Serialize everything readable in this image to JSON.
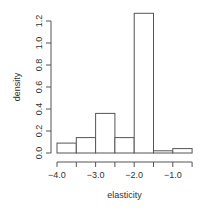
{
  "chart_data": {
    "type": "bar",
    "title": "",
    "xlabel": "elasticity",
    "ylabel": "density",
    "bins": [
      {
        "x0": -4.0,
        "x1": -3.5,
        "density": 0.09
      },
      {
        "x0": -3.5,
        "x1": -3.0,
        "density": 0.14
      },
      {
        "x0": -3.0,
        "x1": -2.5,
        "density": 0.36
      },
      {
        "x0": -2.5,
        "x1": -2.0,
        "density": 0.14
      },
      {
        "x0": -2.0,
        "x1": -1.5,
        "density": 1.27
      },
      {
        "x0": -1.5,
        "x1": -1.0,
        "density": 0.02
      },
      {
        "x0": -1.0,
        "x1": -0.5,
        "density": 0.04
      }
    ],
    "categories": [
      "-4.0–-3.5",
      "-3.5–-3.0",
      "-3.0–-2.5",
      "-2.5–-2.0",
      "-2.0–-1.5",
      "-1.5–-1.0",
      "-1.0–-0.5"
    ],
    "values": [
      0.09,
      0.14,
      0.36,
      0.14,
      1.27,
      0.02,
      0.04
    ],
    "x_ticks": [
      -4.0,
      -3.5,
      -3.0,
      -2.5,
      -2.0,
      -1.5,
      -1.0,
      -0.5
    ],
    "x_tick_labels": [
      "-4.0",
      "-3.0",
      "-2.0",
      "-1.0"
    ],
    "y_ticks": [
      0.0,
      0.2,
      0.4,
      0.6,
      0.8,
      1.0,
      1.2
    ],
    "y_tick_labels": [
      "0.0",
      "0.2",
      "0.4",
      "0.6",
      "0.8",
      "1.0",
      "1.2"
    ],
    "xlim": [
      -4.0,
      -0.5
    ],
    "ylim": [
      0,
      1.2
    ],
    "grid": false,
    "legend": null
  }
}
